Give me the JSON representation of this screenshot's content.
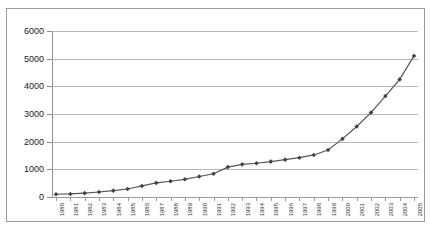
{
  "chart_data": {
    "type": "line",
    "title": "",
    "subtitle": "",
    "xlabel": "",
    "ylabel": "",
    "ylim": [
      0,
      6000
    ],
    "ytick_labels": [
      "0",
      "1000",
      "2000",
      "3000",
      "4000",
      "5000",
      "6000"
    ],
    "ytick_values": [
      0,
      1000,
      2000,
      3000,
      4000,
      5000,
      6000
    ],
    "grid": true,
    "legend": "none",
    "marker": "diamond",
    "line_color": "#555555",
    "marker_color": "#444444",
    "grid_color": "#b9b9b9",
    "categories": [
      "1980",
      "1981",
      "1982",
      "1983",
      "1984",
      "1985",
      "1986",
      "1987",
      "1988",
      "1989",
      "1990",
      "1991",
      "1992",
      "1993",
      "1994",
      "1995",
      "1996",
      "1997",
      "1998",
      "1999",
      "2000",
      "2001",
      "2002",
      "2003",
      "2004",
      "2005"
    ],
    "series": [
      {
        "name": "",
        "values": [
          100,
          110,
          140,
          180,
          230,
          290,
          400,
          510,
          570,
          640,
          740,
          840,
          1080,
          1180,
          1220,
          1280,
          1350,
          1420,
          1520,
          1700,
          2100,
          2550,
          3050,
          3650,
          4250,
          5100
        ]
      }
    ]
  },
  "figure": {
    "border_color": "#9a9a9a",
    "background": "#ffffff"
  }
}
